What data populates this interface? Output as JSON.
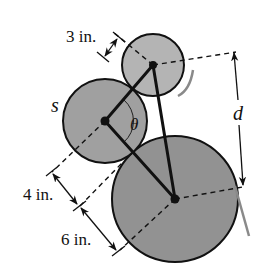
{
  "diagram": {
    "labels": {
      "top_gap": "3 in.",
      "middle_gap": "4 in.",
      "bottom_gap": "6 in.",
      "distance": "d",
      "arc_length": "s",
      "angle": "θ"
    },
    "circles": [
      {
        "name": "small-circle",
        "cx": 153,
        "cy": 65,
        "r": 31,
        "fill": "#b4b4b4"
      },
      {
        "name": "middle-circle",
        "cx": 105,
        "cy": 121,
        "r": 42,
        "fill": "#a0a0a0"
      },
      {
        "name": "large-circle",
        "cx": 175,
        "cy": 199,
        "r": 63,
        "fill": "#929292"
      }
    ],
    "colors": {
      "stroke": "#111111",
      "tangent_mark": "#8a8a8a",
      "background": "#ffffff"
    }
  }
}
